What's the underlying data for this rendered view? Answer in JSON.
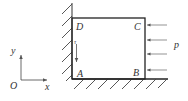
{
  "diagram": {
    "type": "mechanics-schematic",
    "colors": {
      "stroke": "#222222",
      "hatch": "#444444",
      "arrow": "#666666",
      "text": "#333333"
    },
    "block": {
      "corners": {
        "A": "A",
        "B": "B",
        "C": "C",
        "D": "D"
      }
    },
    "load": {
      "label": "p",
      "arrow_count": 4,
      "direction": "left"
    },
    "shear_arrow": {
      "label": "τ",
      "direction": "down"
    },
    "axes": {
      "origin_label": "O",
      "x_label": "x",
      "y_label": "y"
    },
    "supports": {
      "left_wall": "fixed",
      "bottom_floor": "fixed"
    }
  }
}
